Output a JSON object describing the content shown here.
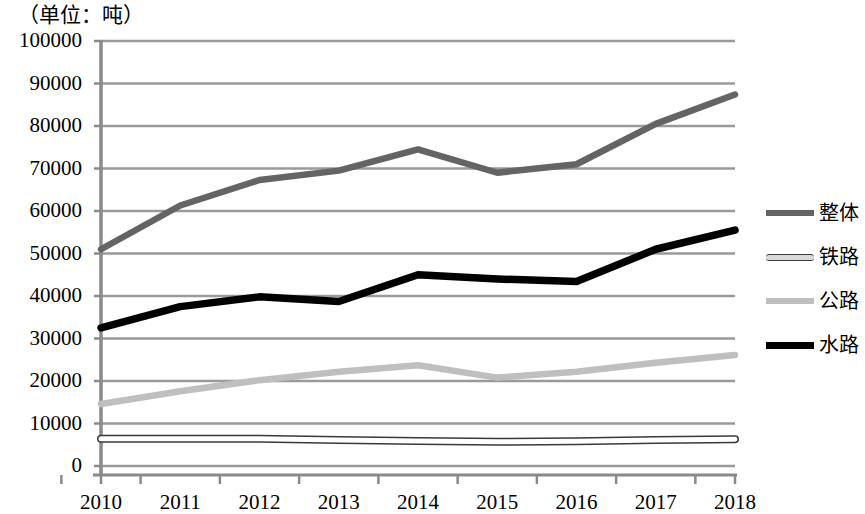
{
  "chart_data": {
    "type": "line",
    "title": "（单位：吨）",
    "xlabel": "",
    "ylabel": "",
    "unit_note": "（单位：吨）",
    "categories": [
      "2010",
      "2011",
      "2012",
      "2013",
      "2014",
      "2015",
      "2016",
      "2017",
      "2018"
    ],
    "ylim": [
      0,
      100000
    ],
    "ytick_step": 10000,
    "yticks": [
      "100000",
      "90000",
      "80000",
      "70000",
      "60000",
      "50000",
      "40000",
      "30000",
      "20000",
      "10000",
      "0"
    ],
    "grid": "horizontal",
    "legend_position": "right",
    "series": [
      {
        "name": "整体",
        "color": "#646464",
        "style": "solid-thick",
        "values": [
          51000,
          61300,
          67300,
          69500,
          74500,
          69000,
          71000,
          80500,
          87400
        ]
      },
      {
        "name": "铁路",
        "color": "#3a3a3a",
        "style": "hollow-thin",
        "values": [
          6400,
          6400,
          6400,
          6100,
          5900,
          5700,
          5800,
          6100,
          6300
        ]
      },
      {
        "name": "公路",
        "color": "#bfbfbf",
        "style": "solid-light",
        "values": [
          14600,
          17600,
          20200,
          22200,
          23700,
          20800,
          22200,
          24300,
          26100
        ]
      },
      {
        "name": "水路",
        "color": "#000000",
        "style": "solid-black",
        "values": [
          32500,
          37500,
          39800,
          38700,
          45000,
          44000,
          43400,
          51000,
          55500
        ]
      }
    ]
  },
  "legend": {
    "items": [
      {
        "label": "整体",
        "swatch": "overall-line-swatch"
      },
      {
        "label": "铁路",
        "swatch": "rail-line-swatch"
      },
      {
        "label": "公路",
        "swatch": "road-line-swatch"
      },
      {
        "label": "水路",
        "swatch": "water-line-swatch"
      }
    ]
  }
}
